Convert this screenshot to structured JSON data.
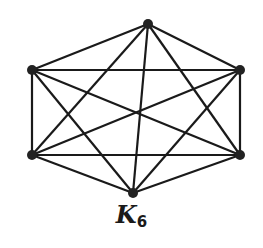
{
  "graph": {
    "name": "K",
    "subscript": "6",
    "vertices": [
      {
        "id": "top",
        "x": 148,
        "y": 24
      },
      {
        "id": "upper-right",
        "x": 240,
        "y": 70
      },
      {
        "id": "lower-right",
        "x": 240,
        "y": 155
      },
      {
        "id": "bottom",
        "x": 133,
        "y": 193
      },
      {
        "id": "lower-left",
        "x": 32,
        "y": 155
      },
      {
        "id": "upper-left",
        "x": 32,
        "y": 70
      }
    ],
    "edge_color": "#1a1a1a",
    "vertex_color": "#222222"
  }
}
